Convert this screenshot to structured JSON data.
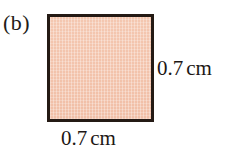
{
  "figure": {
    "label": "(b)",
    "shape": "square",
    "fill_color": "#f3c3ac",
    "border_color": "#241a14",
    "background_color": "#ffffff"
  },
  "dimensions": {
    "right": {
      "value": "0.7",
      "unit": "cm"
    },
    "bottom": {
      "value": "0.7",
      "unit": "cm"
    }
  }
}
